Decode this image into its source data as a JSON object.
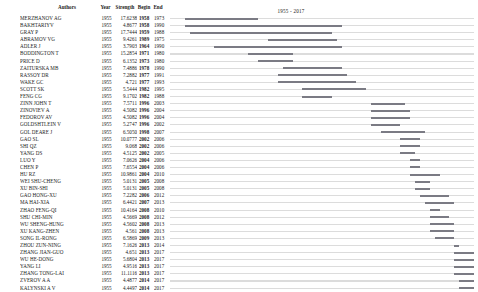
{
  "header": {
    "authors_label": "Authors",
    "year_label": "Year",
    "strength_label": "Strength",
    "begin_label": "Begin",
    "end_label": "End",
    "range_label": "1955 - 2017"
  },
  "timeline": {
    "start_year": 1955,
    "end_year": 2017
  },
  "colors": {
    "baseline": "#dcdcdc",
    "burst": "#7b7b84",
    "text": "#1a1a1a"
  },
  "rows": [
    {
      "author": "MERZHANOV AG",
      "year": "1955",
      "strength": "17.6238",
      "begin": "1958",
      "end": "1973"
    },
    {
      "author": "BAKHTARIYV",
      "year": "1955",
      "strength": "4.8677",
      "begin": "1958",
      "end": "1990"
    },
    {
      "author": "GRAY P",
      "year": "1955",
      "strength": "17.7444",
      "begin": "1959",
      "end": "1988"
    },
    {
      "author": "ABRAMOV VG",
      "year": "1955",
      "strength": "9.4261",
      "begin": "1989",
      "end": "1975"
    },
    {
      "author": "ADLER J",
      "year": "1955",
      "strength": "3.7903",
      "begin": "1964",
      "end": "1990"
    },
    {
      "author": "BODDINGTON T",
      "year": "1955",
      "strength": "15.2854",
      "begin": "1971",
      "end": "1980"
    },
    {
      "author": "PRICE D",
      "year": "1955",
      "strength": "6.1352",
      "begin": "1973",
      "end": "1980"
    },
    {
      "author": "ZAITURSKA MB",
      "year": "1955",
      "strength": "7.4886",
      "begin": "1978",
      "end": "1990"
    },
    {
      "author": "RASSOY DR",
      "year": "1955",
      "strength": "7.2882",
      "begin": "1977",
      "end": "1991"
    },
    {
      "author": "WAKE GC",
      "year": "1955",
      "strength": "4.721",
      "begin": "1977",
      "end": "1993"
    },
    {
      "author": "SCOTT SK",
      "year": "1955",
      "strength": "5.5444",
      "begin": "1982",
      "end": "1995"
    },
    {
      "author": "FENG CG",
      "year": "1955",
      "strength": "9.1702",
      "begin": "1982",
      "end": "1988"
    },
    {
      "author": "ZINN JOHN T",
      "year": "1955",
      "strength": "7.5711",
      "begin": "1996",
      "end": "2003"
    },
    {
      "author": "ZINOVIEV A",
      "year": "1955",
      "strength": "4.5082",
      "begin": "1996",
      "end": "2004"
    },
    {
      "author": "FEDOROV AV",
      "year": "1955",
      "strength": "4.5082",
      "begin": "1996",
      "end": "2004"
    },
    {
      "author": "GOLDSHTLEIN V",
      "year": "1955",
      "strength": "5.2747",
      "begin": "1996",
      "end": "2002"
    },
    {
      "author": "GOL DEARE J",
      "year": "1955",
      "strength": "6.5050",
      "begin": "1998",
      "end": "2007"
    },
    {
      "author": "GAO SL",
      "year": "1955",
      "strength": "10.0777",
      "begin": "2002",
      "end": "2006"
    },
    {
      "author": "SHI QZ",
      "year": "1955",
      "strength": "9.068",
      "begin": "2002",
      "end": "2006"
    },
    {
      "author": "YANG DS",
      "year": "1955",
      "strength": "4.5125",
      "begin": "2002",
      "end": "2005"
    },
    {
      "author": "LUO Y",
      "year": "1955",
      "strength": "7.0626",
      "begin": "2004",
      "end": "2006"
    },
    {
      "author": "CHEN P",
      "year": "1955",
      "strength": "7.6554",
      "begin": "2004",
      "end": "2006"
    },
    {
      "author": "HU RZ",
      "year": "1955",
      "strength": "10.9861",
      "begin": "2004",
      "end": "2010"
    },
    {
      "author": "WEI SHU-CHENG",
      "year": "1955",
      "strength": "5.0131",
      "begin": "2005",
      "end": "2008"
    },
    {
      "author": "XU BIN-SHI",
      "year": "1955",
      "strength": "5.0131",
      "begin": "2005",
      "end": "2008"
    },
    {
      "author": "GAO HONG-XU",
      "year": "1955",
      "strength": "7.2282",
      "begin": "2006",
      "end": "2012"
    },
    {
      "author": "MA HAI-XIA",
      "year": "1955",
      "strength": "6.4421",
      "begin": "2007",
      "end": "2013"
    },
    {
      "author": "ZHAO FENG-QI",
      "year": "1955",
      "strength": "10.4164",
      "begin": "2008",
      "end": "2010"
    },
    {
      "author": "SHU CHI-MIN",
      "year": "1955",
      "strength": "4.5669",
      "begin": "2008",
      "end": "2012"
    },
    {
      "author": "WU SHENG-HUNG",
      "year": "1955",
      "strength": "4.5602",
      "begin": "2008",
      "end": "2013"
    },
    {
      "author": "XU KANG-ZHEN",
      "year": "1955",
      "strength": "4.561",
      "begin": "2008",
      "end": "2013"
    },
    {
      "author": "SONG IL-RONG",
      "year": "1955",
      "strength": "6.5869",
      "begin": "2009",
      "end": "2013"
    },
    {
      "author": "ZHOU ZUN-NING",
      "year": "1955",
      "strength": "7.1626",
      "begin": "2013",
      "end": "2014"
    },
    {
      "author": "ZHANG JIAN-GUO",
      "year": "1955",
      "strength": "4.651",
      "begin": "2013",
      "end": "2017"
    },
    {
      "author": "WU HE-DONG",
      "year": "1955",
      "strength": "5.6804",
      "begin": "2013",
      "end": "2017"
    },
    {
      "author": "YANG LI",
      "year": "1955",
      "strength": "4.9516",
      "begin": "2013",
      "end": "2017"
    },
    {
      "author": "ZHANG TONG-LAI",
      "year": "1955",
      "strength": "11.1116",
      "begin": "2013",
      "end": "2017"
    },
    {
      "author": "ZVEROV A A",
      "year": "1955",
      "strength": "4.4877",
      "begin": "2014",
      "end": "2017"
    },
    {
      "author": "KALYNSKI A V",
      "year": "1955",
      "strength": "4.4497",
      "begin": "2014",
      "end": "2017"
    }
  ]
}
